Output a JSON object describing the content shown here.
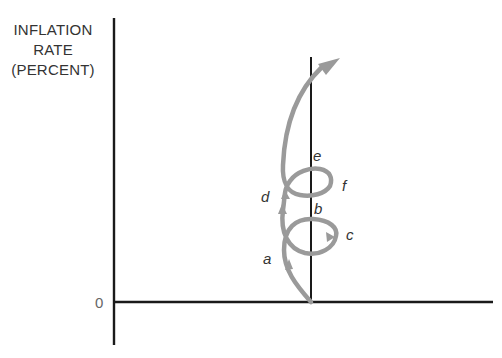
{
  "diagram": {
    "y_axis_label": [
      "INFLATION",
      "RATE",
      "(PERCENT)"
    ],
    "origin_label": "0",
    "points": [
      {
        "id": "a",
        "label": "a"
      },
      {
        "id": "b",
        "label": "b"
      },
      {
        "id": "c",
        "label": "c"
      },
      {
        "id": "d",
        "label": "d"
      },
      {
        "id": "e",
        "label": "e"
      },
      {
        "id": "f",
        "label": "f"
      }
    ],
    "colors": {
      "axis": "#1a1a1a",
      "curve": "#9a9a9a",
      "text": "#333333"
    }
  }
}
